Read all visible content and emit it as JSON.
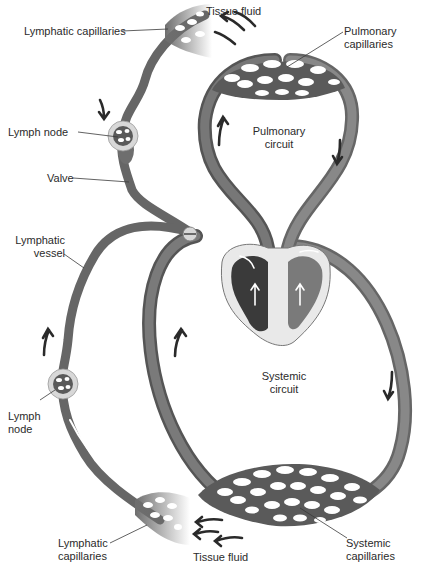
{
  "diagram": {
    "colors": {
      "vessel": "#6e6e6e",
      "vessel_dark": "#4e4e4e",
      "heart_left": "#3a3a3a",
      "heart_right": "#7a7a7a",
      "heart_wall": "#e9e9e9",
      "node_halo": "#d8d8d8",
      "arrow": "#2a2a2a",
      "background": "#ffffff"
    },
    "labels": {
      "tissue_fluid_top": "Tissue fluid",
      "lymphatic_capillaries_top": "Lymphatic capillaries",
      "pulmonary_capillaries": [
        "Pulmonary",
        "capillaries"
      ],
      "lymph_node_top": "Lymph node",
      "pulmonary_circuit": [
        "Pulmonary",
        "circuit"
      ],
      "valve": "Valve",
      "lymphatic_vessel": [
        "Lymphatic",
        "vessel"
      ],
      "systemic_circuit": [
        "Systemic",
        "circuit"
      ],
      "lymph_node_bottom": [
        "Lymph",
        "node"
      ],
      "lymphatic_capillaries_bottom": [
        "Lymphatic",
        "capillaries"
      ],
      "tissue_fluid_bottom": "Tissue fluid",
      "systemic_capillaries": [
        "Systemic",
        "capillaries"
      ]
    },
    "structures": [
      "lymphatic-capillaries-top",
      "lymphatic-vessel-upper",
      "lymph-node-upper",
      "valve",
      "pulmonary-circuit",
      "pulmonary-capillary-bed",
      "heart",
      "systemic-circuit",
      "systemic-capillary-bed",
      "lymphatic-vessel-lower",
      "lymph-node-lower",
      "lymphatic-capillaries-bottom"
    ],
    "flow_arrows": [
      {
        "location": "upper lymphatic vessel",
        "direction": "down"
      },
      {
        "location": "pulmonary circuit left",
        "direction": "up"
      },
      {
        "location": "pulmonary circuit right",
        "direction": "down"
      },
      {
        "location": "lower lymphatic vessel",
        "direction": "up"
      },
      {
        "location": "systemic circuit left",
        "direction": "up"
      },
      {
        "location": "systemic circuit right",
        "direction": "down"
      },
      {
        "location": "tissue fluid top",
        "direction": "up-left"
      },
      {
        "location": "tissue fluid bottom",
        "direction": "left"
      }
    ]
  }
}
